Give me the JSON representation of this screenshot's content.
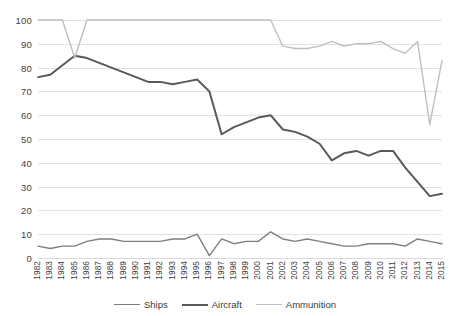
{
  "chart_data": {
    "type": "line",
    "title": "",
    "xlabel": "",
    "ylabel": "",
    "ylim": [
      0,
      100
    ],
    "ytick_step": 10,
    "grid": "horizontal",
    "legend_position": "bottom-center",
    "yticks": [
      "100",
      "90",
      "80",
      "70",
      "60",
      "50",
      "40",
      "30",
      "20",
      "10",
      "0"
    ],
    "categories": [
      "1982",
      "1983",
      "1984",
      "1985",
      "1986",
      "1987",
      "1988",
      "1989",
      "1990",
      "1991",
      "1992",
      "1993",
      "1994",
      "1995",
      "1996",
      "1997",
      "1998",
      "1999",
      "2000",
      "2001",
      "2002",
      "2003",
      "2004",
      "2005",
      "2006",
      "2007",
      "2008",
      "2009",
      "2010",
      "2011",
      "2012",
      "2013",
      "2014",
      "2015"
    ],
    "series": [
      {
        "name": "Ships",
        "color": "#7f7f7f",
        "width": 1.4,
        "values": [
          5,
          4,
          5,
          5,
          7,
          8,
          8,
          7,
          7,
          7,
          7,
          8,
          8,
          10,
          1,
          8,
          6,
          7,
          7,
          11,
          8,
          7,
          8,
          7,
          6,
          5,
          5,
          6,
          6,
          6,
          5,
          8,
          7,
          6
        ]
      },
      {
        "name": "Aircraft",
        "color": "#595959",
        "width": 2.0,
        "values": [
          76,
          77,
          81,
          85,
          84,
          82,
          80,
          78,
          76,
          74,
          74,
          73,
          74,
          75,
          70,
          52,
          55,
          57,
          59,
          60,
          54,
          53,
          51,
          48,
          41,
          44,
          45,
          43,
          45,
          45,
          38,
          32,
          26,
          27
        ]
      },
      {
        "name": "Ammunition",
        "color": "#bfbfbf",
        "width": 1.4,
        "values": [
          100,
          100,
          100,
          84,
          100,
          100,
          100,
          100,
          100,
          100,
          100,
          100,
          100,
          100,
          100,
          100,
          100,
          100,
          100,
          100,
          89,
          88,
          88,
          89,
          91,
          89,
          90,
          90,
          91,
          88,
          86,
          91,
          56,
          83
        ]
      }
    ]
  }
}
